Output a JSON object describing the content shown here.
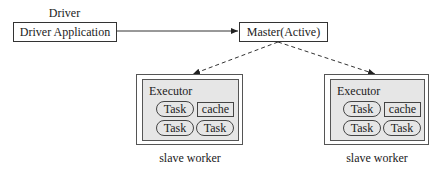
{
  "driver": {
    "heading": "Driver",
    "box_label": "Driver Application"
  },
  "master": {
    "label": "Master(Active)"
  },
  "workers": [
    {
      "executor_label": "Executor",
      "tasks": [
        "Task",
        "Task",
        "Task"
      ],
      "cache_label": "cache",
      "caption": "slave worker"
    },
    {
      "executor_label": "Executor",
      "tasks": [
        "Task",
        "Task",
        "Task"
      ],
      "cache_label": "cache",
      "caption": "slave worker"
    }
  ],
  "colors": {
    "line": "#333333",
    "executor_fill": "#e6e6e6",
    "border": "#555555"
  }
}
